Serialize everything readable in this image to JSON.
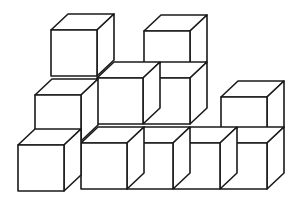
{
  "diagram": {
    "title": "",
    "stroke_color": "#1a1a1a",
    "background": "#ffffff",
    "cube_size": 46,
    "depth_offset": [
      17,
      -16
    ],
    "cubes": [
      {
        "id": "top-left",
        "x": 51,
        "y": 30
      },
      {
        "id": "top-right",
        "x": 144,
        "y": 31
      },
      {
        "id": "middle-left",
        "x": 35,
        "y": 95
      },
      {
        "id": "middle-center-1",
        "x": 97,
        "y": 78
      },
      {
        "id": "middle-center-2",
        "x": 144,
        "y": 78
      },
      {
        "id": "right-upper",
        "x": 221,
        "y": 97
      },
      {
        "id": "bottom-left",
        "x": 18,
        "y": 145
      },
      {
        "id": "bottom-1",
        "x": 81,
        "y": 143
      },
      {
        "id": "bottom-2",
        "x": 127,
        "y": 143
      },
      {
        "id": "bottom-3",
        "x": 174,
        "y": 143
      },
      {
        "id": "bottom-4",
        "x": 221,
        "y": 143
      }
    ]
  }
}
